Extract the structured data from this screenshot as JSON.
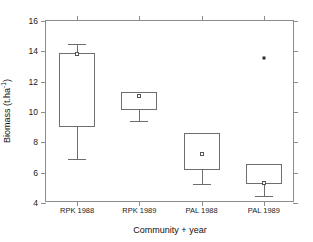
{
  "chart_data": {
    "type": "box",
    "title": "",
    "xlabel": "Community + year",
    "ylabel": "Biomass (t.ha",
    "ylabel_sup": "-1",
    "ylabel_tail": ")",
    "categories": [
      "RPK 1988",
      "RPK 1989",
      "PAL 1988",
      "PAL 1989"
    ],
    "ylim": [
      4,
      16
    ],
    "yticks": [
      4,
      6,
      8,
      10,
      12,
      14,
      16
    ],
    "ytick_labels": [
      "4",
      "6",
      "8",
      "10",
      "12",
      "14",
      "16"
    ],
    "grid": false,
    "legend": "none",
    "boxes": [
      {
        "category": "RPK 1988",
        "whisker_high": 14.5,
        "q3": 13.9,
        "mean": 13.8,
        "q1": 9.0,
        "whisker_low": 6.9,
        "outliers": []
      },
      {
        "category": "RPK 1989",
        "whisker_high": 11.35,
        "q3": 11.3,
        "mean": 11.05,
        "q1": 10.1,
        "whisker_low": 9.4,
        "outliers": []
      },
      {
        "category": "PAL 1988",
        "whisker_high": 8.6,
        "q3": 8.6,
        "mean": 7.2,
        "q1": 6.15,
        "whisker_low": 5.25,
        "outliers": []
      },
      {
        "category": "PAL 1989",
        "whisker_high": 6.55,
        "q3": 6.55,
        "mean": 5.35,
        "q1": 5.25,
        "whisker_low": 4.45,
        "outliers": [
          13.55
        ]
      }
    ],
    "colors": {
      "axis": "#8c8c8c",
      "box_stroke": "#6e6e6e",
      "marker": "#2a2a2a",
      "background": "#ffffff",
      "text": "#1a1a1a"
    }
  }
}
